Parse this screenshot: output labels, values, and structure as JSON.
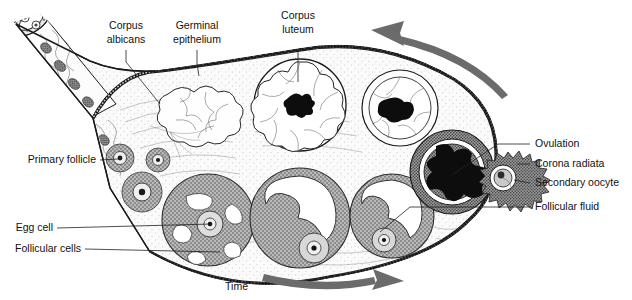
{
  "diagram": {
    "background_color": "#ffffff",
    "ink_color": "#111111",
    "arrow_color": "#6b6b6b"
  },
  "labels": {
    "corpus_albicans": "Corpus\nalbicans",
    "corpus_albicans_line1": "Corpus",
    "corpus_albicans_line2": "albicans",
    "germinal_epithelium_line1": "Germinal",
    "germinal_epithelium_line2": "epithelium",
    "corpus_luteum_line1": "Corpus",
    "corpus_luteum_line2": "luteum",
    "primary_follicle": "Primary follicle",
    "egg_cell": "Egg cell",
    "follicular_cells": "Follicular cells",
    "ovulation": "Ovulation",
    "corona_radiata": "Corona radiata",
    "secondary_oocyte": "Secondary oocyte",
    "follicular_fluid": "Follicular fluid",
    "time": "Time"
  },
  "structures": {
    "hilum": "ovarian-hilum-cut-tube",
    "corpus_albicans": "scar-lobulated",
    "corpus_luteum_count": 2,
    "primary_follicles_count": 4,
    "growing_follicles_count": 3,
    "ruptured_follicle": "dark-blood-clot",
    "released_oocyte": "corona-radiata-spiky"
  },
  "arrows": {
    "top": {
      "name": "cycle-arrow-top",
      "direction": "counter-clockwise-left"
    },
    "bottom": {
      "name": "time-arrow-bottom",
      "direction": "right"
    }
  }
}
